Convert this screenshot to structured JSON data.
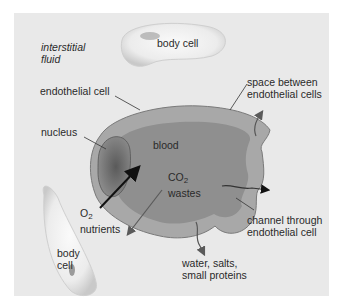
{
  "diagram": {
    "type": "capillary-exchange-illustration",
    "labels": {
      "interstitial_fluid_1": "interstitial",
      "interstitial_fluid_2": "fluid",
      "body_cell_top": "body cell",
      "endothelial_cell": "endothelial cell",
      "nucleus": "nucleus",
      "blood": "blood",
      "space_between_1": "space between",
      "space_between_2": "endothelial cells",
      "co2_prefix": "CO",
      "co2_sub": "2",
      "wastes": "wastes",
      "o2_prefix": "O",
      "o2_sub": "2",
      "nutrients": "nutrients",
      "channel_1": "channel through",
      "channel_2": "endothelial cell",
      "body_cell_bottom_1": "body",
      "body_cell_bottom_2": "cell",
      "water_1": "water, salts,",
      "water_2": "small proteins"
    },
    "colors": {
      "background_panel": "#e9e9e9",
      "blood": "#8f8f8f",
      "endothelium": "#a8a8a8",
      "nucleus": "#6e6e6e",
      "body_cell": "#f4f4f4",
      "arrow_dark": "#111111",
      "arrow_gray": "#5a5a5a"
    }
  }
}
